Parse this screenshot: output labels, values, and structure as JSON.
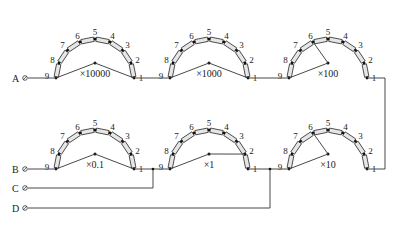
{
  "terminals": [
    {
      "label": "A",
      "x": 22,
      "y": 78
    },
    {
      "label": "B",
      "x": 22,
      "y": 169
    },
    {
      "label": "C",
      "x": 22,
      "y": 188
    },
    {
      "label": "D",
      "x": 22,
      "y": 208
    }
  ],
  "dials": [
    {
      "id": "x10000",
      "multiplier": "×10000",
      "cx": 95,
      "cy": 78,
      "r": 39,
      "wiper_position": 0,
      "wiper_tip": "center"
    },
    {
      "id": "x1000",
      "multiplier": "×1000",
      "cx": 209,
      "cy": 78,
      "r": 39,
      "wiper_position": 0,
      "wiper_tip": "center"
    },
    {
      "id": "x100",
      "multiplier": "×100",
      "cx": 328,
      "cy": 78,
      "r": 39,
      "wiper_position": 6,
      "wiper_tip": "6"
    },
    {
      "id": "x0.1",
      "multiplier": "×0.1",
      "cx": 95,
      "cy": 169,
      "r": 39,
      "wiper_position": 0,
      "wiper_tip": "center"
    },
    {
      "id": "x1",
      "multiplier": "×1",
      "cx": 209,
      "cy": 169,
      "r": 39,
      "wiper_position": 2,
      "wiper_tip": "2"
    },
    {
      "id": "x10",
      "multiplier": "×10",
      "cx": 328,
      "cy": 169,
      "r": 39,
      "wiper_position": 6,
      "wiper_tip": "6"
    }
  ],
  "tap_labels": [
    "1",
    "2",
    "3",
    "4",
    "5",
    "6",
    "7",
    "8",
    "9"
  ],
  "colors": {
    "wire": "#333333",
    "resistor_fill": "#e6e6e6",
    "node": "#111111"
  }
}
